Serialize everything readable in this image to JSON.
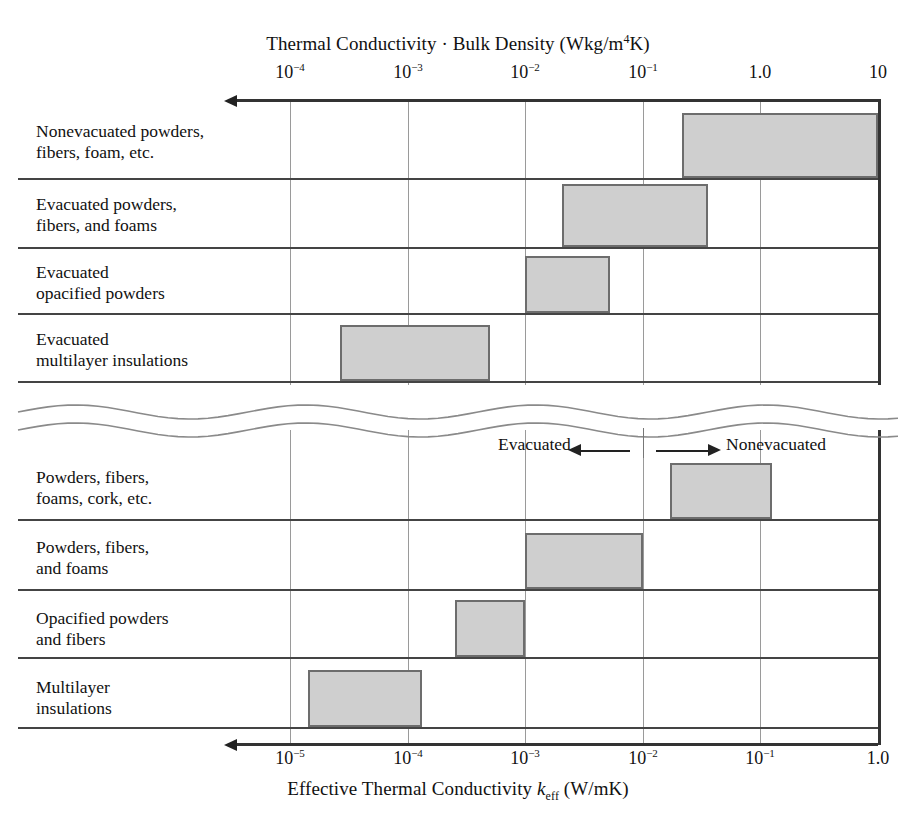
{
  "figure": {
    "top_axis_title": "Thermal Conductivity · Bulk Density (Wkg/m⁴K)",
    "bottom_axis_title_plain": "Effective Thermal Conductivity k_eff (W/mK)",
    "annotation_left": "Evacuated",
    "annotation_right": "Nonevacuated"
  },
  "chart_data": {
    "type": "bar",
    "orientation": "horizontal",
    "xlabel_top": "Thermal Conductivity · Bulk Density (Wkg/m⁴K)",
    "xlabel_bottom": "Effective Thermal Conductivity k_eff (W/mK)",
    "xscale": "log",
    "x_direction": "decreasing-to-the-left",
    "grid": true,
    "legend": null,
    "top_axis": {
      "ticks": [
        0.0001,
        0.001,
        0.01,
        0.1,
        1.0,
        10
      ],
      "tick_labels": [
        "10⁻⁴",
        "10⁻³",
        "10⁻²",
        "10⁻¹",
        "1.0",
        "10"
      ],
      "xlim": [
        0.0001,
        10
      ]
    },
    "bottom_axis": {
      "ticks": [
        1e-05,
        0.0001,
        0.001,
        0.01,
        0.1,
        1.0
      ],
      "tick_labels": [
        "10⁻⁵",
        "10⁻⁴",
        "10⁻³",
        "10⁻²",
        "10⁻¹",
        "1.0"
      ],
      "xlim": [
        1e-05,
        1.0
      ]
    },
    "panels": [
      {
        "name": "upper-panel",
        "axis": "top",
        "quantity": "Thermal Conductivity · Bulk Density (Wkg/m⁴K)",
        "bars": [
          {
            "label": "Nonevacuated powders, fibers, foam, etc.",
            "label_lines": [
              "Nonevacuated powders,",
              "fibers, foam, etc."
            ],
            "xmin": 0.22,
            "xmax": 10
          },
          {
            "label": "Evacuated powders, fibers, and foams",
            "label_lines": [
              "Evacuated powders,",
              "fibers, and foams"
            ],
            "xmin": 0.013,
            "xmax": 0.26
          },
          {
            "label": "Evacuated opacified powders",
            "label_lines": [
              "Evacuated",
              "opacified powders"
            ],
            "xmin": 0.01,
            "xmax": 0.044
          },
          {
            "label": "Evacuated multilayer insulations",
            "label_lines": [
              "Evacuated",
              "multilayer insulations"
            ],
            "xmin": 0.00038,
            "xmax": 0.0035
          }
        ]
      },
      {
        "name": "lower-panel",
        "axis": "bottom",
        "quantity": "Effective Thermal Conductivity k_eff (W/mK)",
        "bars": [
          {
            "label": "Powders, fibers, foams, cork, etc.",
            "label_lines": [
              "Powders, fibers,",
              "foams, cork, etc."
            ],
            "xmin": 0.018,
            "xmax": 0.12
          },
          {
            "label": "Powders, fibers, and foams",
            "label_lines": [
              "Powders, fibers,",
              "and foams"
            ],
            "xmin": 0.001,
            "xmax": 0.01
          },
          {
            "label": "Opacified powders and fibers",
            "label_lines": [
              "Opacified powders",
              "and fibers"
            ],
            "xmin": 0.00035,
            "xmax": 0.001
          },
          {
            "label": "Multilayer insulations",
            "label_lines": [
              "Multilayer",
              "insulations"
            ],
            "xmin": 1.6e-05,
            "xmax": 0.00012
          }
        ]
      }
    ]
  },
  "geometry": {
    "gridlines_px": [
      290,
      408,
      525,
      643,
      760,
      878
    ],
    "plot_left_px": 290,
    "plot_right_px": 878
  },
  "colors": {
    "bar_fill": "#cfcfcf",
    "bar_stroke": "#6d6d6d",
    "gridline": "#9a9a9a",
    "axis": "#333333",
    "text": "#111111"
  },
  "top_tick_labels": [
    {
      "text": "10",
      "sup": "−4",
      "x": 290
    },
    {
      "text": "10",
      "sup": "−3",
      "x": 408
    },
    {
      "text": "10",
      "sup": "−2",
      "x": 525
    },
    {
      "text": "10",
      "sup": "−1",
      "x": 643
    },
    {
      "text": "1.0",
      "sup": "",
      "x": 760
    },
    {
      "text": "10",
      "sup": "",
      "x": 878
    }
  ],
  "bottom_tick_labels": [
    {
      "text": "10",
      "sup": "−5",
      "x": 290
    },
    {
      "text": "10",
      "sup": "−4",
      "x": 408
    },
    {
      "text": "10",
      "sup": "−3",
      "x": 525
    },
    {
      "text": "10",
      "sup": "−2",
      "x": 643
    },
    {
      "text": "10",
      "sup": "−1",
      "x": 760
    },
    {
      "text": "1.0",
      "sup": "",
      "x": 878
    }
  ],
  "rows": [
    {
      "label_lines": [
        "Nonevacuated powders,",
        "fibers, foam, etc."
      ],
      "label_top": 121,
      "rule_y": 178,
      "bar": {
        "x": 682,
        "w": 196,
        "y": 113,
        "h": 65
      }
    },
    {
      "label_lines": [
        "Evacuated powders,",
        "fibers, and foams"
      ],
      "label_top": 194,
      "rule_y": 247,
      "bar": {
        "x": 562,
        "w": 146,
        "y": 184,
        "h": 63
      }
    },
    {
      "label_lines": [
        "Evacuated",
        "opacified powders"
      ],
      "label_top": 262,
      "rule_y": 313,
      "bar": {
        "x": 525,
        "w": 85,
        "y": 256,
        "h": 57
      }
    },
    {
      "label_lines": [
        "Evacuated",
        "multilayer insulations"
      ],
      "label_top": 329,
      "rule_y": 381,
      "bar": {
        "x": 340,
        "w": 150,
        "y": 325,
        "h": 56
      }
    },
    {
      "label_lines": [
        "Powders, fibers,",
        "foams, cork, etc."
      ],
      "label_top": 467,
      "rule_y": 519,
      "bar": {
        "x": 670,
        "w": 102,
        "y": 463,
        "h": 56
      }
    },
    {
      "label_lines": [
        "Powders, fibers,",
        "and foams"
      ],
      "label_top": 537,
      "rule_y": 589,
      "bar": {
        "x": 525,
        "w": 118,
        "y": 533,
        "h": 56
      }
    },
    {
      "label_lines": [
        "Opacified powders",
        "and fibers"
      ],
      "label_top": 608,
      "rule_y": 657,
      "bar": {
        "x": 455,
        "w": 70,
        "y": 600,
        "h": 57
      }
    },
    {
      "label_lines": [
        "Multilayer",
        "insulations"
      ],
      "label_top": 677,
      "rule_y": 727,
      "bar": {
        "x": 308,
        "w": 114,
        "y": 670,
        "h": 57
      }
    }
  ]
}
